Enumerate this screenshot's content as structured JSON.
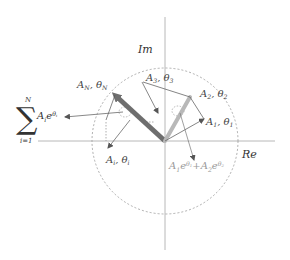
{
  "diagram": {
    "colors": {
      "axis": "#b0b0b0",
      "circle": "#9a9a9a",
      "dark_vector": "#6e6e6e",
      "light_vector": "#b8b8b8",
      "arrow": "#555555",
      "text": "#444444",
      "light_text": "#9a9a9a"
    },
    "axes": {
      "imag_label": "Im",
      "real_label": "Re"
    },
    "summation": {
      "symbol": "∑",
      "upper_limit": "N",
      "lower_limit": "i=1",
      "term_base": "A",
      "term_sub": "i",
      "term_exp_base": "e",
      "term_exp": "θ",
      "term_exp_sub": "i"
    },
    "vector_labels": [
      {
        "id": "AN",
        "amp": "A",
        "amp_sub": "N",
        "sep": ", ",
        "phase": "θ",
        "phase_sub": "N"
      },
      {
        "id": "A3",
        "amp": "A",
        "amp_sub": "3",
        "sep": ", ",
        "phase": "θ",
        "phase_sub": "3"
      },
      {
        "id": "A2",
        "amp": "A",
        "amp_sub": "2",
        "sep": ", ",
        "phase": "θ",
        "phase_sub": "2"
      },
      {
        "id": "A1",
        "amp": "A",
        "amp_sub": "1",
        "sep": ", ",
        "phase": "θ",
        "phase_sub": "1"
      },
      {
        "id": "Ai",
        "amp": "A",
        "amp_sub": "i",
        "sep": ", ",
        "phase": "θ",
        "phase_sub": "i"
      }
    ],
    "partial_sum": {
      "t1_amp": "A",
      "t1_sub": "1",
      "t1_e": "e",
      "t1_exp": "θ",
      "t1_exp_sub": "1",
      "plus": "+",
      "t2_amp": "A",
      "t2_sub": "2",
      "t2_e": "e",
      "t2_exp": "θ",
      "t2_exp_sub": "2"
    }
  }
}
